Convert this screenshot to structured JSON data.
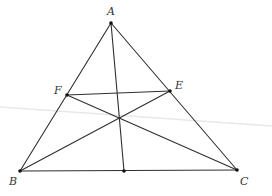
{
  "diagram": {
    "colors": {
      "line": "#2f2f2f",
      "point": "#111111",
      "label": "#333333",
      "background": "#ffffff",
      "fold": "#e8e8e8"
    },
    "points": {
      "A": {
        "label": "A",
        "x": 111,
        "y": 23,
        "lx": 107,
        "ly": 15
      },
      "B": {
        "label": "B",
        "x": 20,
        "y": 171,
        "lx": 9,
        "ly": 185
      },
      "C": {
        "label": "C",
        "x": 237,
        "y": 170,
        "lx": 240,
        "ly": 185
      },
      "E": {
        "label": "E",
        "x": 170,
        "y": 91,
        "lx": 175,
        "ly": 89
      },
      "F": {
        "label": "F",
        "x": 67,
        "y": 95,
        "lx": 54,
        "ly": 94
      },
      "D": {
        "label": "",
        "x": 124,
        "y": 171
      },
      "G": {
        "label": "",
        "x": 120,
        "y": 118
      }
    },
    "segments": [
      {
        "from": "A",
        "to": "B"
      },
      {
        "from": "A",
        "to": "C"
      },
      {
        "from": "B",
        "to": "C"
      },
      {
        "from": "A",
        "to": "D"
      },
      {
        "from": "B",
        "to": "E"
      },
      {
        "from": "C",
        "to": "F"
      },
      {
        "from": "F",
        "to": "E"
      }
    ],
    "fold_line": {
      "x1": 0,
      "y1": 107,
      "x2": 272,
      "y2": 126
    }
  }
}
